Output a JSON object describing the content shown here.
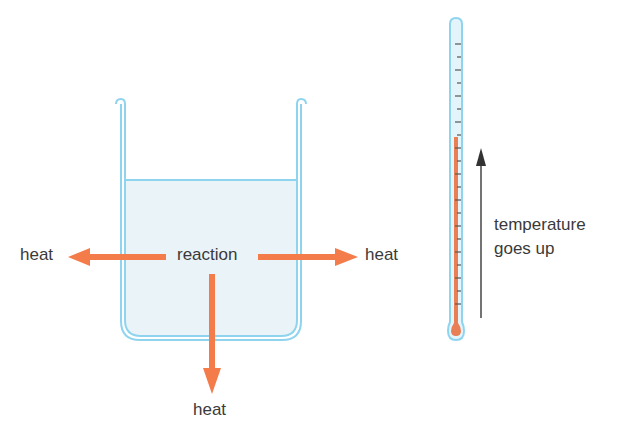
{
  "diagram": {
    "labels": {
      "reaction": "reaction",
      "heat_left": "heat",
      "heat_right": "heat",
      "heat_bottom": "heat",
      "temperature_line1": "temperature",
      "temperature_line2": "goes up"
    },
    "colors": {
      "glass_outline": "#8fd4ee",
      "liquid_fill": "#eaf3f8",
      "heat_arrow": "#f47c4a",
      "mercury": "#e97f55",
      "text": "#3a3a3a",
      "indicator_arrow": "#444444",
      "tick": "#555555"
    },
    "components": {
      "beaker": {
        "name": "beaker",
        "contains": "liquid"
      },
      "heat_arrows": [
        {
          "direction": "left",
          "label": "heat"
        },
        {
          "direction": "right",
          "label": "heat"
        },
        {
          "direction": "down",
          "label": "heat"
        }
      ],
      "thermometer": {
        "name": "thermometer",
        "tick_count": 24,
        "reading": "rising"
      },
      "indicator_arrow": {
        "direction": "up",
        "label": "temperature goes up"
      }
    }
  }
}
